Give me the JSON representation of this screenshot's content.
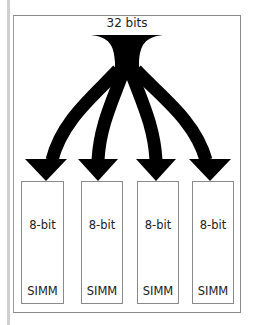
{
  "diagram": {
    "title": "32 bits",
    "bus_width_label": "32 bits",
    "modules": [
      {
        "bits": "8-bit",
        "type": "SIMM",
        "left": 21,
        "width": 43
      },
      {
        "bits": "8-bit",
        "type": "SIMM",
        "left": 81,
        "width": 42
      },
      {
        "bits": "8-bit",
        "type": "SIMM",
        "left": 137,
        "width": 42
      },
      {
        "bits": "8-bit",
        "type": "SIMM",
        "left": 192,
        "width": 42
      }
    ],
    "colors": {
      "arrow": "#000000",
      "border": "#8a8a8a",
      "side_bar": "#cfcfcf",
      "text": "#222222"
    }
  }
}
